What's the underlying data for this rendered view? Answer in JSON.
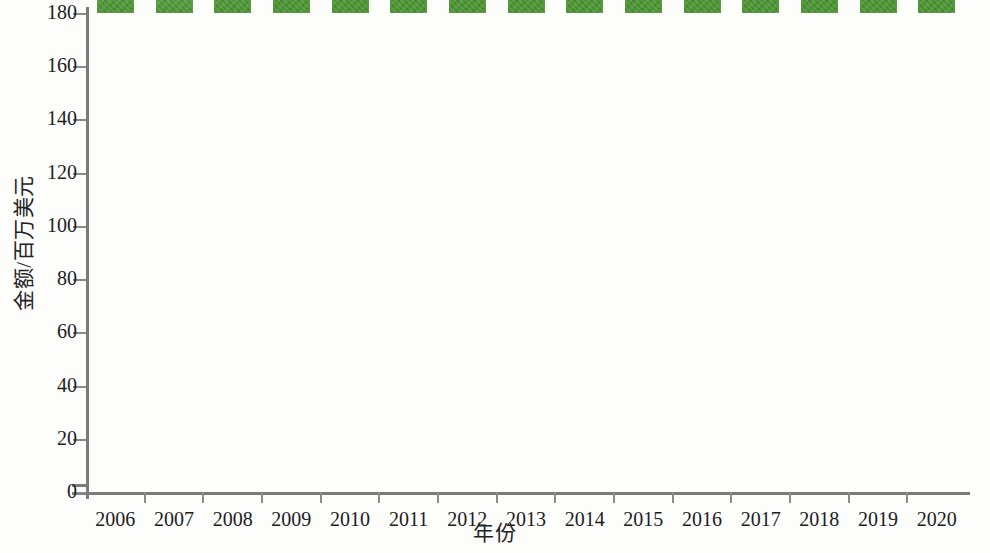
{
  "chart_data": {
    "type": "bar",
    "title": "",
    "xlabel": "年份",
    "ylabel": "金额/百万美元",
    "categories": [
      "2006",
      "2007",
      "2008",
      "2009",
      "2010",
      "2011",
      "2012",
      "2013",
      "2014",
      "2015",
      "2016",
      "2017",
      "2018",
      "2019",
      "2020"
    ],
    "values": [
      25,
      13,
      36,
      121,
      105.5,
      122,
      151.5,
      150,
      119.5,
      99.5,
      81,
      90.5,
      161.5,
      144,
      135
    ],
    "series": [
      {
        "name": "金额/百万美元",
        "values": [
          25,
          13,
          36,
          121,
          105.5,
          122,
          151.5,
          150,
          119.5,
          99.5,
          81,
          90.5,
          161.5,
          144,
          135
        ]
      }
    ],
    "ylim": [
      0,
      180
    ],
    "ytick_labels": [
      "0",
      "20",
      "40",
      "60",
      "80",
      "100",
      "120",
      "140",
      "160",
      "180"
    ],
    "ytick_values": [
      0,
      20,
      40,
      60,
      80,
      100,
      120,
      140,
      160,
      180
    ],
    "grid": false,
    "legend": "none",
    "bar_color": "#4f9f36",
    "axis_color": "#7b7b7b",
    "background_color": "#ffffff"
  }
}
